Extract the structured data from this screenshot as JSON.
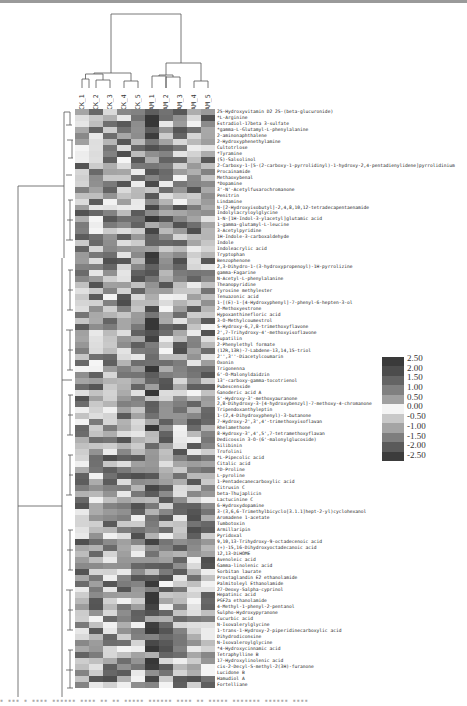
{
  "chart_data": {
    "type": "heatmap",
    "title": "",
    "xlabel": "",
    "ylabel": "",
    "clustering": {
      "rows": true,
      "columns": true
    },
    "columns": [
      "CK_1",
      "CK_2",
      "CK_3",
      "CK_4",
      "CK_5",
      "AM_1",
      "AM_2",
      "AM_3",
      "AM_4",
      "AM_5"
    ],
    "column_dendrogram_groups": [
      [
        "CK_1",
        "CK_2",
        "CK_3",
        "CK_4",
        "CK_5"
      ],
      [
        "AM_1",
        "AM_2",
        "AM_3",
        "AM_4",
        "AM_5"
      ]
    ],
    "rows": [
      "25-Hydroxyvitamin D2 25-(beta-glucuronide)",
      "*L-Arginine",
      "Estradiol-17beta 3-sulfate",
      "*gamma-L-Glutamyl-L-phenylalanine",
      "2-aminonaphthalene",
      "2-Hydroxyphenethylamine",
      "Cultotrlose",
      "*Tyramine",
      "(S)-Salsolinol",
      "2-Carboxy-1-[5-(2-carboxy-1-pyrrolidinyl)-1-hydroxy-2,4-pentadienylidene]pyrrolidinium",
      "Procainamide",
      "Methaoxybenal",
      "*Dopamine",
      "3'-N'-Acetylfusarochromanone",
      "Penitrin",
      "Lindamine",
      "N-[2-Hydroxyisobutyl]-2,4,8,10,12-tetradecapentaenamide",
      "Indolylacryloylglycine",
      "1-N-[1H-Indol-3-ylacetyl]glutamic acid",
      "1-gamma-glutamyl-L-leucine",
      "3-Acetylpyridine",
      "1H-Indole-3-carboxaldehyde",
      "Indole",
      "Indoleacrylic acid",
      "Tryptophan",
      "Benzophenone",
      "2,3-Dihydro-1-(3-hydroxypropenoyl)-1H-pyrrolizine",
      "gamma-Fagarine",
      "N-Acetyl-L-phenylalanine",
      "Theanopyridine",
      "Tyrosine methylester",
      "Tenuazonic acid",
      "1-[(E)-1-[4-Hydroxyphenyl]-7-phenyl-6-hepten-3-ol",
      "2-Methoxyestrone",
      "Hypoxanthinefloric acid",
      "3-O-Methylcoumestrol",
      "5-Hydroxy-6,7,8-trimethoxyflavone",
      "2',7-Trihydroxy-4'-methoxyisoflavone",
      "Eupatilin",
      "2-Phenylethyl formate",
      "(12R,13R)-7-Labdene-13,14,15-triol",
      "2'',3''-Diacetylcoumarin",
      "Oxonin",
      "Trigonenna",
      "6'-O-Malonyldaidzin",
      "13'-carboxy-gamma-tocotrienol",
      "Pubescenside",
      "Ganoderic acid A",
      "5'-Hydroxy-3'-methoxyauranone",
      "2,8-Dihydroxy-3-[4-hydroxybenzyl]-7-methoxy-4-chromanone",
      "Tripendoxanthyleptin",
      "1-(2,4-Dihydroxyphenyl)-3-butanone",
      "7-Hydroxy-2',3',4'-trimethoxyisoflavan",
      "Rhelamethone",
      "8-Hydroxy-3',4',5',7-tetramethoxyflavan",
      "Dedicossin 3-O-(6'-malonylglucoside)",
      "Silibinin",
      "Trofolini",
      "*L-Pipecolic acid",
      "Citalic acid",
      "*D-Proline",
      "L-pyroline",
      "1-Pentadecanecarboxylic acid",
      "Citrusin C",
      "beta-Thujaplicin",
      "Lactucinine C",
      "6-Hydroxydopamine",
      "3-(3,6,6-Trimethylbicyclo[3.1.1]hept-2-yl)cyclohexanol",
      "Aromadene 1-acetate",
      "Tumbotoxin",
      "Armillaripin",
      "Pyridoxal",
      "9,10,13-Trihydroxy-9-octadecenoic acid",
      "(+)-15,16-Dihydroxyoctadecanoic acid",
      "12,13-DiHOME",
      "Avenoleic acid",
      "Gamma-linolenic acid",
      "Sorbitan laurate",
      "Prostaglandin E2 ethanolamide",
      "Palmitoleyl Ethanolamide",
      "27-Deoxy-5alpha-cyprinol",
      "Hepatinic acid",
      "PGF2a ethanolamide",
      "4-Methyl-1-phenyl-2-pentanol",
      "Sulpho-Hydroxypyranone",
      "Cucurbic acid",
      "N-Isovalerylglycine",
      "1-trans-1-Hydroxy-2-piperidinecarboxylic acid",
      "Dihydrodiconsine",
      "N-Isovaleroylglycine",
      "*4-Hydroxycinnamic acid",
      "Tetraphylline B",
      "17-Hydroxylinolenic acid",
      "cis-2-Decyl-5-methyl-2(3H)-furanone",
      "Lucidone B",
      "Hamudiol A",
      "Fortelliane"
    ],
    "color_scale": {
      "min": -2.5,
      "max": 2.5,
      "ticks": [
        "2.50",
        "2.00",
        "1.50",
        "1.00",
        "0.50",
        "0.00",
        "-0.50",
        "-1.00",
        "-1.50",
        "-2.00",
        "-2.50"
      ],
      "colors": [
        "#3a3a3a",
        "#4c4c4c",
        "#646464",
        "#808080",
        "#a0a0a0",
        "#f4f4f4",
        "#c8c8c8",
        "#a4a4a4",
        "#7e7e7e",
        "#5a5a5a",
        "#3c3c3c"
      ]
    },
    "legend_position": "right"
  },
  "figure": {
    "caption_hint": "Figure caption (illegible at this resolution)"
  }
}
